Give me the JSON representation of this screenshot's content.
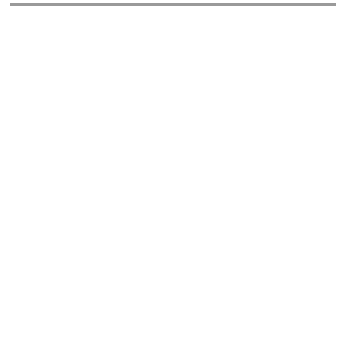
{
  "puzzle": {
    "type": "word-search",
    "colors": {
      "ink": "#2a2a2a",
      "outline": "#3a3a3a",
      "rule": "#9a9a9a"
    },
    "rows": [
      {
        "start_col": 7,
        "letters": "NA"
      },
      {
        "start_col": 5,
        "letters": "TODCTN"
      },
      {
        "start_col": 3,
        "letters": "PRNHIROPRS"
      },
      {
        "start_col": 2,
        "letters": "TAAERMGEAEUD"
      },
      {
        "start_col": 2,
        "letters": "EGXCSATMRCBE"
      },
      {
        "start_col": 1,
        "letters": "HOALRTRRUATMLE"
      },
      {
        "start_col": 1,
        "letters": "NGESNKYIILAOLR"
      },
      {
        "start_col": 0,
        "letters": "ROLDEAIPAZLNHIEP"
      },
      {
        "start_col": 0,
        "letters": "NEOPIBTANEEGRPHP"
      },
      {
        "start_col": 1,
        "letters": "NDCEAEGGPLLLSP"
      },
      {
        "start_col": 1,
        "letters": "IONTRMCLAOEAES"
      },
      {
        "start_col": 2,
        "letters": "RGIAAOERGAVL"
      },
      {
        "start_col": 2,
        "letters": "EPALGUNTREOY"
      },
      {
        "start_col": 3,
        "letters": "NACYOQDAYA"
      },
      {
        "start_col": 5,
        "letters": "GECNSM"
      },
      {
        "start_col": 7,
        "letters": "DE"
      }
    ]
  }
}
